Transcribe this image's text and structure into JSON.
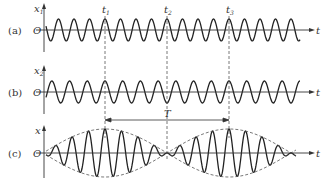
{
  "figure": {
    "title": "",
    "panels": [
      {
        "label": "(a)",
        "y_axis": "x1",
        "origin": "O",
        "x_axis": "t",
        "signal": "x1"
      },
      {
        "label": "(b)",
        "y_axis": "x2",
        "origin": "O",
        "x_axis": "t",
        "signal": "x2"
      },
      {
        "label": "(c)",
        "y_axis": "x",
        "origin": "O",
        "x_axis": "t",
        "signal": "x = x1 + x2"
      }
    ],
    "markers": [
      {
        "label": "t1",
        "main": "t",
        "sub": "1"
      },
      {
        "label": "t2",
        "main": "t",
        "sub": "2"
      },
      {
        "label": "t3",
        "main": "t",
        "sub": "3"
      }
    ],
    "period_label": "T",
    "colors": {
      "line": "#222222",
      "dash": "#555555",
      "axis": "#333333"
    }
  }
}
